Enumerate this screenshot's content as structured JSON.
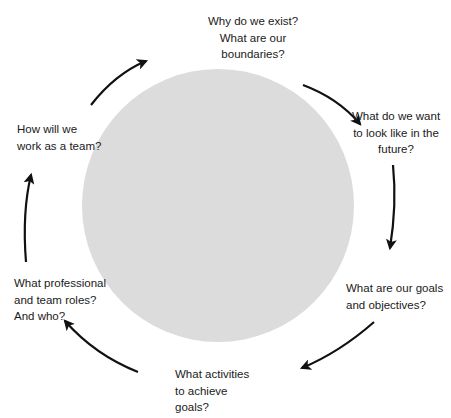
{
  "diagram": {
    "type": "cycle",
    "center_circle_color": "#dcdcdc",
    "arrow_color": "#111111",
    "steps": [
      {
        "id": "purpose",
        "lines": [
          "Why do we exist?",
          "What are our",
          "boundaries?"
        ]
      },
      {
        "id": "vision",
        "lines": [
          "What do we want",
          "to look like in the",
          "future?"
        ]
      },
      {
        "id": "goals",
        "lines": [
          "What are our goals",
          "and objectives?"
        ]
      },
      {
        "id": "activities",
        "lines": [
          "What activities",
          "to achieve",
          "goals?"
        ]
      },
      {
        "id": "roles",
        "lines": [
          "What professional",
          "and team roles?",
          "And who?"
        ]
      },
      {
        "id": "teamwork",
        "lines": [
          "How will we",
          "work as a team?"
        ]
      }
    ]
  }
}
